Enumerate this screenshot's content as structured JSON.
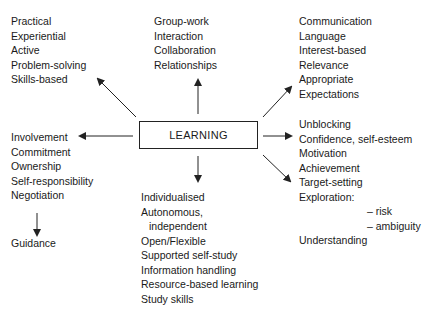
{
  "diagram": {
    "center": {
      "label": "LEARNING"
    },
    "branches": {
      "top_left": [
        "Practical",
        "Experiential",
        "Active",
        "Problem-solving",
        "Skills-based"
      ],
      "top_center": [
        "Group-work",
        "Interaction",
        "Collaboration",
        "Relationships"
      ],
      "top_right": [
        "Communication",
        "Language",
        "Interest-based",
        "Relevance",
        "Appropriate",
        "Expectations"
      ],
      "left": [
        "Involvement",
        "Commitment",
        "Ownership",
        "Self-responsibility",
        "Negotiation"
      ],
      "left_sub": "Guidance",
      "bottom": [
        "Individualised",
        "Autonomous,",
        "independent",
        "Open/Flexible",
        "Supported self-study",
        "Information handling",
        "Resource-based learning",
        "Study skills"
      ],
      "right": [
        "Unblocking",
        "Confidence, self-esteem",
        "Motivation",
        "Achievement",
        "Target-setting",
        "Exploration:"
      ],
      "right_sub": [
        "– risk",
        "– ambiguity"
      ],
      "right_end": "Understanding"
    },
    "colors": {
      "line": "#222222",
      "text": "#1a1a1a",
      "background": "#ffffff"
    }
  }
}
